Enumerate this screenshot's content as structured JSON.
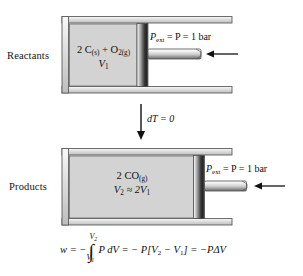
{
  "figure": {
    "background_color": "#ffffff",
    "ink_color": "#101010"
  },
  "top_system": {
    "side_label": "Reactants",
    "chamber_line1_prefix": "2 C",
    "chamber_line1_sub1": "(s)",
    "chamber_line1_mid": " + O",
    "chamber_line1_sub2": "2(g)",
    "chamber_line2_symbol": "V",
    "chamber_line2_sub": "1",
    "pressure_label_main": "P",
    "pressure_label_sub": "ext",
    "pressure_label_rest": " = P = 1 bar",
    "piston_position_note": "piston near middle of cylinder"
  },
  "transition": {
    "label": "dT = 0",
    "arrow_direction": "down"
  },
  "bottom_system": {
    "side_label": "Products",
    "chamber_line1_prefix": "2 CO",
    "chamber_line1_sub1": "(g)",
    "chamber_line2_symbol": "V",
    "chamber_line2_sub": "2",
    "chamber_line2_rel": " ≈ 2V",
    "chamber_line2_sub2": "1",
    "pressure_label_main": "P",
    "pressure_label_sub": "ext",
    "pressure_label_rest": " = P = 1 bar",
    "piston_position_note": "piston pushed right, volume doubled"
  },
  "equation": {
    "lhs": "w = −",
    "integral_upper_sym": "V",
    "integral_upper_sub": "2",
    "integral_lower_sym": "V",
    "integral_lower_sub": "1",
    "integrand": "P dV",
    "mid": " = − P[V",
    "mid_sub1": "2",
    "mid2": " − V",
    "mid_sub2": "1",
    "mid3": "] = −PΔV",
    "full_text": "w = −∫(V1→V2) P dV = −P[V2 − V1] = −PΔV"
  },
  "colors": {
    "chamber_fill": "#d2d2d2",
    "wall_light": "#f4f4f4",
    "wall_dark": "#c3c3c3",
    "piston_dark": "#2e2e2e",
    "outline": "#5e5e5e"
  }
}
